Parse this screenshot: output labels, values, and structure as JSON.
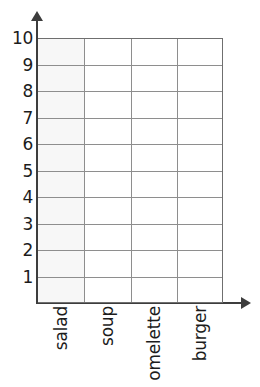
{
  "chart_data": {
    "type": "bar",
    "title": "",
    "xlabel": "",
    "ylabel": "",
    "categories": [
      "salad",
      "soup",
      "omelette",
      "burger"
    ],
    "values": [
      0,
      0,
      0,
      0
    ],
    "series": [
      {
        "name": "",
        "values": [
          0,
          0,
          0,
          0
        ]
      }
    ],
    "ylim": [
      0,
      10
    ],
    "y_ticks": [
      10,
      9,
      8,
      7,
      6,
      5,
      4,
      3,
      2,
      1
    ],
    "grid": true,
    "legend": "none",
    "note": "Empty bar-chart template: blank 10-row by 4-column grid with no bars drawn."
  },
  "axes": {
    "y_axis_name": "y-axis",
    "x_axis_name": "x-axis",
    "y_arrow_icon": "arrow-up-icon",
    "x_arrow_icon": "arrow-right-icon"
  },
  "title_remnant": "",
  "colors": {
    "gridline": "#8e8e8e",
    "axis": "#3d3d3d",
    "grid_border": "#6f6f6f",
    "text": "#1c1c1c",
    "first_column_fill": "#f7f7f7",
    "background": "#ffffff"
  }
}
